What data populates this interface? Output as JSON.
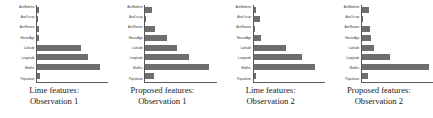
{
  "figure": {
    "title": "",
    "panel_count": 4,
    "bar_color": "#6e6e6e",
    "axis_color": "#5a5a5a",
    "background": "#ffffff"
  },
  "chart_data": [
    {
      "type": "bar",
      "orientation": "horizontal",
      "title": "Lime features: Observation 1",
      "caption_lines": [
        "Lime features:",
        "Observation 1"
      ],
      "categories": [
        "AveBedrms",
        "AveOccup",
        "AveRooms",
        "HouseAge",
        "Latitude",
        "Longitude",
        "MedInc",
        "Population"
      ],
      "values": [
        0.03,
        0.005,
        0.03,
        0.03,
        0.62,
        0.72,
        0.88,
        0.04
      ],
      "xlabel": "",
      "ylabel": "",
      "xlim": [
        0,
        1
      ],
      "grid": false,
      "legend": false
    },
    {
      "type": "bar",
      "orientation": "horizontal",
      "title": "Proposed features: Observation 1",
      "caption_lines": [
        "Proposed features:",
        "Observation 1"
      ],
      "categories": [
        "AveBedrms",
        "AveOccup",
        "AveRooms",
        "HouseAge",
        "Latitude",
        "Longitude",
        "MedInc",
        "Population"
      ],
      "values": [
        0.1,
        0.01,
        0.14,
        0.3,
        0.44,
        0.62,
        0.9,
        0.12
      ],
      "xlabel": "",
      "ylabel": "",
      "xlim": [
        0,
        1
      ],
      "grid": false,
      "legend": false
    },
    {
      "type": "bar",
      "orientation": "horizontal",
      "title": "Lime features: Observation 2",
      "caption_lines": [
        "Lime features:",
        "Observation 2"
      ],
      "categories": [
        "AveBedrms",
        "AveOccup",
        "AveRooms",
        "HouseAge",
        "Latitude",
        "Longitude",
        "MedInc",
        "Population"
      ],
      "values": [
        0.04,
        0.09,
        0.01,
        0.1,
        0.45,
        0.68,
        0.86,
        0.04
      ],
      "xlabel": "",
      "ylabel": "",
      "xlim": [
        0,
        1
      ],
      "grid": false,
      "legend": false
    },
    {
      "type": "bar",
      "orientation": "horizontal",
      "title": "Proposed features: Observation 2",
      "caption_lines": [
        "Proposed features:",
        "Observation 2"
      ],
      "categories": [
        "AveBedrms",
        "AveOccup",
        "AveRooms",
        "HouseAge",
        "Latitude",
        "Longitude",
        "MedInc",
        "Population"
      ],
      "values": [
        0.1,
        0.02,
        0.12,
        0.13,
        0.17,
        0.4,
        0.95,
        0.09
      ],
      "xlabel": "",
      "ylabel": "",
      "xlim": [
        0,
        1
      ],
      "grid": false,
      "legend": false
    }
  ]
}
